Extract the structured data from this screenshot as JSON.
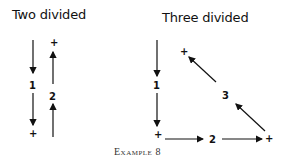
{
  "panels": [
    {
      "title": "Two divided",
      "labels": {
        "first": "1",
        "second": "2",
        "plus_top": "+",
        "plus_bottom": "+"
      }
    },
    {
      "title": "Three divided",
      "labels": {
        "first": "1",
        "second": "2",
        "third": "3",
        "plus_top": "+",
        "plus_bottom_left": "+",
        "plus_bottom_right": "+"
      }
    }
  ],
  "caption": "Example 8"
}
